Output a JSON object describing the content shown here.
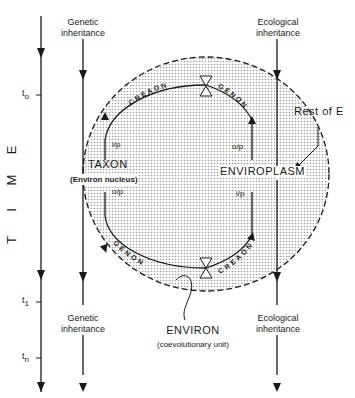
{
  "diagram": {
    "time_axis": {
      "label_letters": [
        "E",
        "M",
        "I",
        "T"
      ],
      "label": "TIME",
      "ticks": [
        "t",
        "t",
        "t"
      ],
      "tick_subscripts": [
        "o",
        "1",
        "n"
      ]
    },
    "left_stream": {
      "top_label": [
        "Genetic",
        "inheritance"
      ],
      "bottom_label": [
        "Genetic",
        "inheritance"
      ]
    },
    "right_stream": {
      "top_label": [
        "Ecological",
        "inheritance"
      ],
      "bottom_label": [
        "Ecological",
        "inheritance"
      ]
    },
    "loop_labels": {
      "top_left": "CREAON",
      "top_right": "GENON",
      "bottom_left": "GENON",
      "bottom_right": "CREAON"
    },
    "flow_labels": {
      "left_upper": "i/p",
      "left_lower": "o/p",
      "right_upper": "o/p",
      "right_lower": "i/p"
    },
    "taxon": {
      "title": "TAXON",
      "subtitle": "(Environ nucleus)"
    },
    "enviroplasm": "ENVIROPLASM",
    "rest_of_e": "Rest of E",
    "environ": {
      "title": "ENVIRON",
      "subtitle": "(coevolutionary unit)"
    },
    "colors": {
      "line": "#1a1a1a",
      "fill_stipple": "#c8c8c8",
      "background": "#ffffff"
    }
  }
}
